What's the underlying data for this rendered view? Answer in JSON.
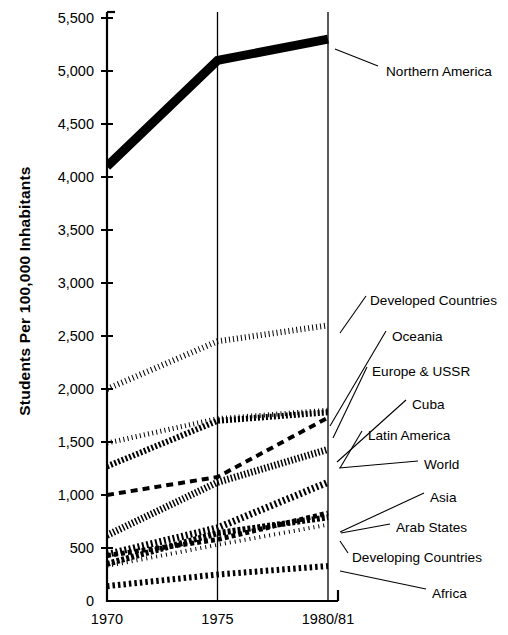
{
  "chart_data": {
    "type": "line",
    "title": "",
    "xlabel": "",
    "ylabel": "Students Per 100,000 Inhabitants",
    "x": [
      "1970",
      "1975",
      "1980/81"
    ],
    "xtick_labels": [
      "1970",
      "1975",
      "1980/81"
    ],
    "ytick_labels": [
      "0",
      "500",
      "1,000",
      "1,500",
      "2,000",
      "2,500",
      "3,000",
      "3,500",
      "4,000",
      "4,500",
      "5,000",
      "5,500"
    ],
    "ytick_values": [
      0,
      500,
      1000,
      1500,
      2000,
      2500,
      3000,
      3500,
      4000,
      4500,
      5000,
      5500
    ],
    "ylim": [
      0,
      5500
    ],
    "grid": "vertical-lines-at-each-x",
    "legend_position": "right-inline-leader-labels",
    "series": [
      {
        "name": "Northern America",
        "values": [
          4100,
          5100,
          5300
        ],
        "pattern": "solid-thick",
        "stroke_width": 9,
        "dash": "none",
        "label_x": 386,
        "label_y": 71,
        "leader": [
          [
            335,
            49
          ],
          [
            378,
            66
          ]
        ]
      },
      {
        "name": "Developed Countries",
        "values": [
          2000,
          2450,
          2600
        ],
        "pattern": "chain-circles",
        "stroke_width": 6,
        "dash": "1 3",
        "label_x": 370,
        "label_y": 300,
        "leader": [
          [
            340,
            333
          ],
          [
            366,
            296
          ]
        ]
      },
      {
        "name": "Oceania",
        "values": [
          1490,
          1720,
          1800
        ],
        "pattern": "fine-dotted",
        "stroke_width": 5,
        "dash": "1 3.2",
        "label_x": 392,
        "label_y": 336,
        "leader": [
          [
            330,
            426
          ],
          [
            386,
            331
          ]
        ]
      },
      {
        "name": "Europe & USSR",
        "values": [
          1270,
          1700,
          1780
        ],
        "pattern": "dense-beads",
        "stroke_width": 6,
        "dash": "2 2",
        "label_x": 372,
        "label_y": 371,
        "leader": [
          [
            333,
            438
          ],
          [
            367,
            367
          ]
        ]
      },
      {
        "name": "Cuba",
        "values": [
          1000,
          1170,
          1730
        ],
        "pattern": "long-dash",
        "stroke_width": 4,
        "dash": "7 5",
        "label_x": 412,
        "label_y": 404,
        "leader": [
          [
            337,
            462
          ],
          [
            406,
            400
          ]
        ]
      },
      {
        "name": "Latin America",
        "values": [
          620,
          1120,
          1430
        ],
        "pattern": "hatch-vertical",
        "stroke_width": 7,
        "dash": "1.5 2",
        "label_x": 368,
        "label_y": 435,
        "leader": [
          [
            340,
            468
          ],
          [
            362,
            431
          ]
        ]
      },
      {
        "name": "World",
        "values": [
          440,
          690,
          1120
        ],
        "pattern": "slash-hatch",
        "stroke_width": 7,
        "dash": "2 2.5",
        "label_x": 424,
        "label_y": 464,
        "leader": [
          [
            339,
            468
          ],
          [
            418,
            461
          ]
        ]
      },
      {
        "name": "Asia",
        "values": [
          430,
          580,
          830
        ],
        "pattern": "dash-dot",
        "stroke_width": 5,
        "dash": "4 3",
        "label_x": 430,
        "label_y": 497,
        "leader": [
          [
            340,
            532
          ],
          [
            424,
            493
          ]
        ]
      },
      {
        "name": "Arab States",
        "values": [
          350,
          640,
          790
        ],
        "pattern": "mixed-dash",
        "stroke_width": 6,
        "dash": "3 2",
        "label_x": 396,
        "label_y": 527,
        "leader": [
          [
            341,
            533
          ],
          [
            390,
            524
          ]
        ]
      },
      {
        "name": "Developing Countries",
        "values": [
          330,
          530,
          720
        ],
        "pattern": "sparse-dots",
        "stroke_width": 4,
        "dash": "1 4",
        "label_x": 352,
        "label_y": 557,
        "leader": [
          [
            340,
            541
          ],
          [
            348,
            553
          ]
        ]
      },
      {
        "name": "Africa",
        "values": [
          140,
          250,
          330
        ],
        "pattern": "open-circles",
        "stroke_width": 6,
        "dash": "2.5 3",
        "label_x": 432,
        "label_y": 593,
        "leader": [
          [
            340,
            571
          ],
          [
            426,
            589
          ]
        ]
      }
    ]
  },
  "axes": {
    "y_axis_title": "Students Per 100,000 Inhabitants",
    "x_axis_title": ""
  }
}
